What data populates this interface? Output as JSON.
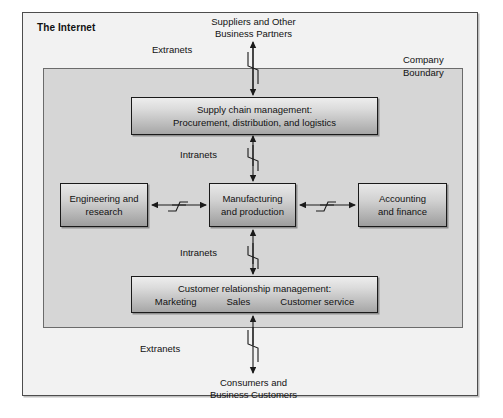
{
  "diagram": {
    "outer_frame_label": "The Internet",
    "inner_frame_label_line1": "Company",
    "inner_frame_label_line2": "Boundary",
    "external_actors": {
      "top": {
        "line1": "Suppliers and Other",
        "line2": "Business Partners"
      },
      "bottom": {
        "line1": "Consumers and",
        "line2": "Business Customers"
      }
    },
    "network_labels": {
      "extranet_top": "Extranets",
      "extranet_bottom": "Extranets",
      "intranet_upper": "Intranets",
      "intranet_lower": "Intranets"
    },
    "processes": {
      "supply_chain": {
        "line1": "Supply chain management:",
        "line2": "Procurement, distribution, and logistics"
      },
      "engineering": {
        "line1": "Engineering and",
        "line2": "research"
      },
      "manufacturing": {
        "line1": "Manufacturing",
        "line2": "and production"
      },
      "accounting": {
        "line1": "Accounting",
        "line2": "and finance"
      },
      "crm": {
        "line1": "Customer relationship management:",
        "sub1": "Marketing",
        "sub2": "Sales",
        "sub3": "Customer service"
      }
    },
    "colors": {
      "page_background": "#ffffff",
      "internet_fill": "#f2f2f2",
      "company_fill": "#d6d6d6",
      "box_gradient_top": "#e8e8e8",
      "box_gradient_bottom": "#9d9d9d",
      "stroke": "#1a1a1a"
    }
  }
}
